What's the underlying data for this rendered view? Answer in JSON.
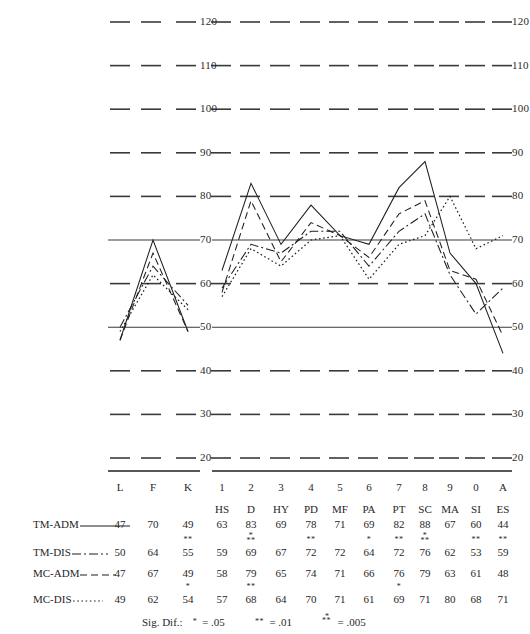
{
  "chart_data": {
    "type": "line",
    "title": "",
    "xlabel": "",
    "ylabel": "",
    "ylim": [
      20,
      120
    ],
    "yticks": [
      120,
      110,
      100,
      90,
      80,
      70,
      60,
      50,
      40,
      30,
      20
    ],
    "grid": true,
    "legend_position": "left-table",
    "reference_lines": [
      70,
      50
    ],
    "panels": [
      {
        "name": "validity-scales",
        "categories": [
          "L",
          "F",
          "K"
        ],
        "subcategories": [
          "",
          "",
          ""
        ]
      },
      {
        "name": "clinical-scales",
        "categories": [
          "1",
          "2",
          "3",
          "4",
          "5",
          "6",
          "7",
          "8",
          "9",
          "0",
          "A"
        ],
        "subcategories": [
          "HS",
          "D",
          "HY",
          "PD",
          "MF",
          "PA",
          "PT",
          "SC",
          "MA",
          "SI",
          "ES"
        ]
      }
    ],
    "series": [
      {
        "name": "TM-ADM",
        "style": "solid",
        "validity_values": [
          47,
          70,
          49
        ],
        "clinical_values": [
          63,
          83,
          69,
          78,
          71,
          69,
          82,
          88,
          67,
          60,
          44
        ]
      },
      {
        "name": "TM-DIS",
        "style": "dash-dot",
        "validity_values": [
          50,
          64,
          55
        ],
        "clinical_values": [
          59,
          69,
          67,
          72,
          72,
          64,
          72,
          76,
          62,
          53,
          59
        ]
      },
      {
        "name": "MC-ADM",
        "style": "dashed",
        "validity_values": [
          47,
          67,
          49
        ],
        "clinical_values": [
          58,
          79,
          65,
          74,
          71,
          66,
          76,
          79,
          63,
          61,
          48
        ]
      },
      {
        "name": "MC-DIS",
        "style": "dotted",
        "validity_values": [
          49,
          62,
          54
        ],
        "clinical_values": [
          57,
          68,
          64,
          70,
          71,
          61,
          69,
          71,
          80,
          68,
          71
        ]
      }
    ]
  },
  "axis": {
    "ticks": [
      "120",
      "110",
      "100",
      "90",
      "80",
      "70",
      "60",
      "50",
      "40",
      "30",
      "20"
    ]
  },
  "table": {
    "left_headers": [
      "L",
      "F",
      "K"
    ],
    "right_headers": [
      "1",
      "2",
      "3",
      "4",
      "5",
      "6",
      "7",
      "8",
      "9",
      "0",
      "A"
    ],
    "right_subheaders": [
      "HS",
      "D",
      "HY",
      "PD",
      "MF",
      "PA",
      "PT",
      "SC",
      "MA",
      "SI",
      "ES"
    ],
    "rows": [
      {
        "label": "TM-ADM",
        "line_style": "solid",
        "left_values": [
          "47",
          "70",
          "49"
        ],
        "left_sig": [
          "",
          "",
          ""
        ],
        "right_values": [
          "63",
          "83",
          "69",
          "78",
          "71",
          "69",
          "82",
          "88",
          "67",
          "60",
          "44"
        ],
        "right_sig": [
          "",
          "",
          "",
          "",
          "",
          "",
          "",
          "",
          "",
          "",
          ""
        ]
      },
      {
        "label": "TM-DIS",
        "line_style": "dash-dot",
        "left_values": [
          "50",
          "64",
          "55"
        ],
        "left_sig": [
          "",
          "",
          "**"
        ],
        "right_values": [
          "59",
          "69",
          "67",
          "72",
          "72",
          "64",
          "72",
          "76",
          "62",
          "53",
          "59"
        ],
        "right_sig": [
          "",
          "***",
          "",
          "**",
          "",
          "*",
          "**",
          "***",
          "",
          "**",
          "**"
        ]
      },
      {
        "label": "MC-ADM",
        "line_style": "dashed",
        "left_values": [
          "47",
          "67",
          "49"
        ],
        "left_sig": [
          "",
          "",
          ""
        ],
        "right_values": [
          "58",
          "79",
          "65",
          "74",
          "71",
          "66",
          "76",
          "79",
          "63",
          "61",
          "48"
        ],
        "right_sig": [
          "",
          "",
          "",
          "",
          "",
          "",
          "",
          "",
          "",
          "",
          ""
        ]
      },
      {
        "label": "MC-DIS",
        "line_style": "dotted",
        "left_values": [
          "49",
          "62",
          "54"
        ],
        "left_sig": [
          "",
          "",
          "*"
        ],
        "right_values": [
          "57",
          "68",
          "64",
          "70",
          "71",
          "61",
          "69",
          "71",
          "80",
          "68",
          "71"
        ],
        "right_sig": [
          "",
          "**",
          "",
          "",
          "",
          "",
          "*",
          "",
          "",
          "",
          ""
        ]
      }
    ]
  },
  "footer": {
    "prefix": "Sig. Dif.:",
    "item1_mark": "*",
    "item1_eq": "=  .05",
    "item2_mark": "**",
    "item2_eq": "=  .01",
    "item3_top": "*",
    "item3_bot": "**",
    "item3_eq": "=  .005"
  },
  "colors": {
    "ink": "#1f1f1f",
    "line": "#2b2b2b",
    "grid": "#3a3a3a",
    "background": "#ffffff"
  }
}
